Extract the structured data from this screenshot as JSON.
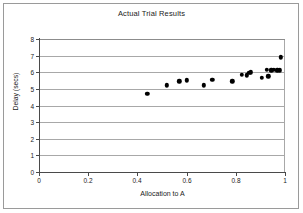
{
  "chart_data": {
    "type": "scatter",
    "title": "Actual Trial Results",
    "xlabel": "Allocation to A",
    "ylabel": "Delay (secs)",
    "xlim": [
      0,
      1
    ],
    "ylim": [
      0,
      8
    ],
    "grid": true,
    "legend": null,
    "xticks": [
      "0",
      "0.2",
      "0.4",
      "0.6",
      "0.8",
      "1"
    ],
    "xtick_values": [
      0,
      0.2,
      0.4,
      0.6,
      0.8,
      1
    ],
    "yticks": [
      "0",
      "1",
      "2",
      "3",
      "4",
      "5",
      "6",
      "7",
      "8"
    ],
    "ytick_values": [
      0,
      1,
      2,
      3,
      4,
      5,
      6,
      7,
      8
    ],
    "marker": "filled-circle",
    "marker_color": "#000000",
    "series": [
      {
        "name": "Trial",
        "points": [
          {
            "x": 0.44,
            "y": 4.7
          },
          {
            "x": 0.52,
            "y": 5.22
          },
          {
            "x": 0.57,
            "y": 5.45
          },
          {
            "x": 0.6,
            "y": 5.52
          },
          {
            "x": 0.67,
            "y": 5.22
          },
          {
            "x": 0.705,
            "y": 5.55
          },
          {
            "x": 0.785,
            "y": 5.45
          },
          {
            "x": 0.825,
            "y": 5.85
          },
          {
            "x": 0.845,
            "y": 5.82
          },
          {
            "x": 0.855,
            "y": 5.98
          },
          {
            "x": 0.862,
            "y": 6.0
          },
          {
            "x": 0.905,
            "y": 5.68
          },
          {
            "x": 0.925,
            "y": 6.15
          },
          {
            "x": 0.932,
            "y": 5.75
          },
          {
            "x": 0.945,
            "y": 6.12
          },
          {
            "x": 0.955,
            "y": 6.15
          },
          {
            "x": 0.968,
            "y": 6.12
          },
          {
            "x": 0.978,
            "y": 6.12
          },
          {
            "x": 0.982,
            "y": 6.9
          }
        ]
      }
    ]
  },
  "axes": {
    "y_title": "Delay (secs)",
    "x_title": "Allocation to A"
  },
  "title": "Actual Trial Results"
}
